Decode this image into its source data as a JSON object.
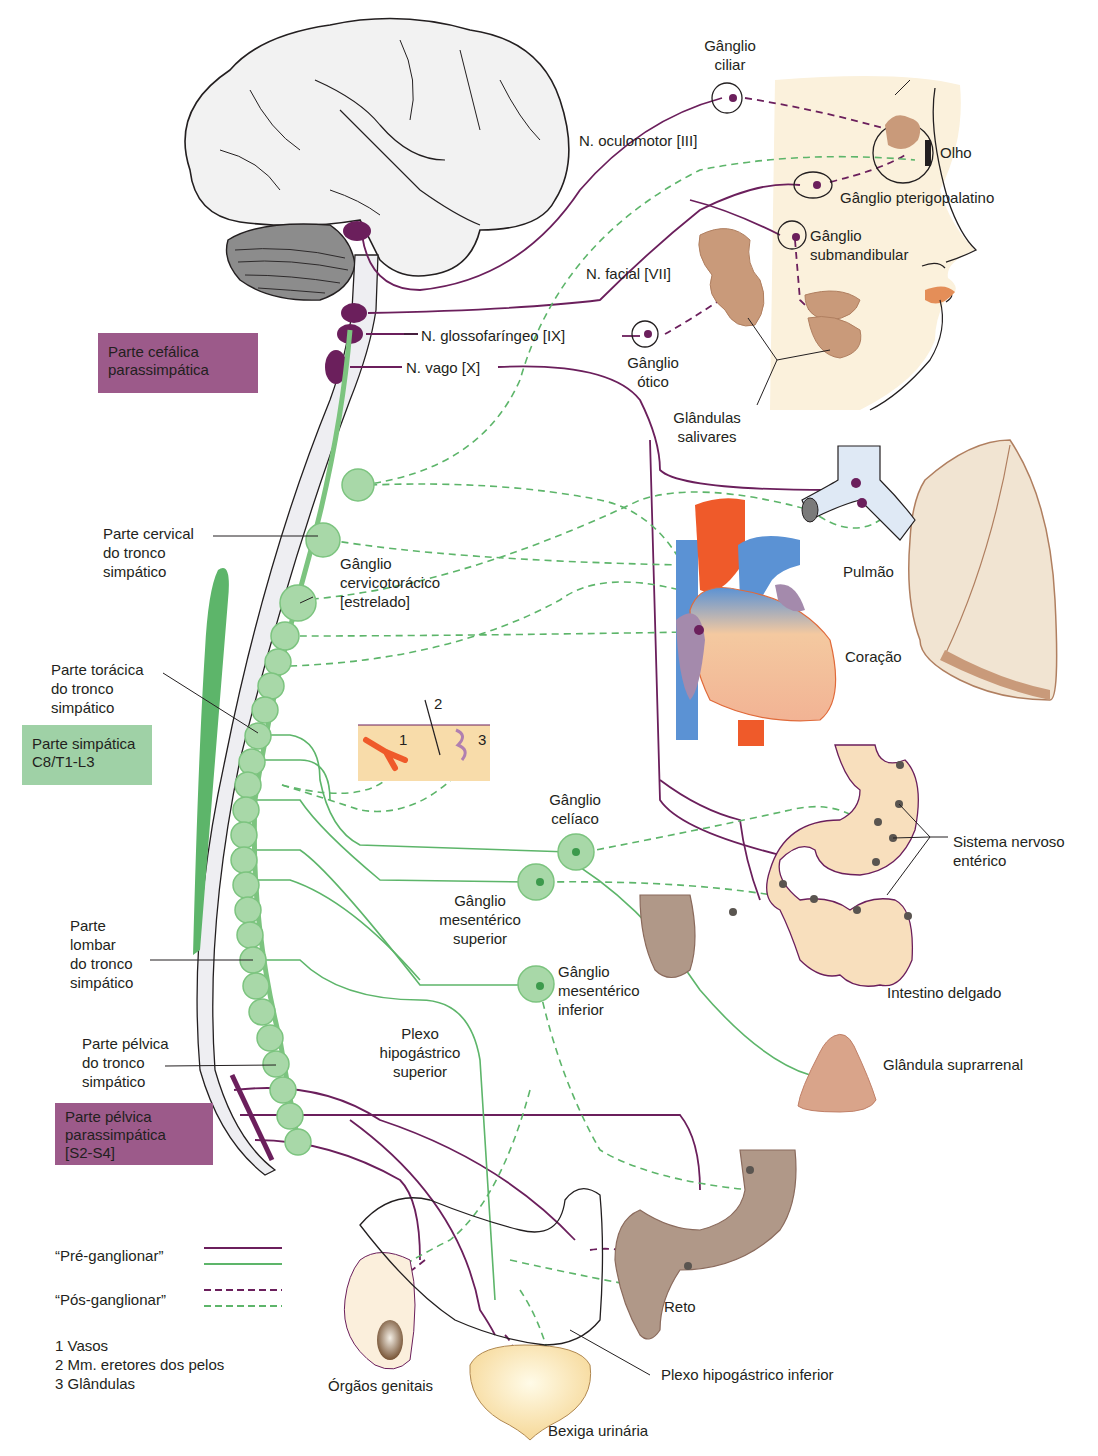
{
  "colors": {
    "parasympathetic": "#6b1f5c",
    "sympathetic": "#5db56a",
    "ganglion_fill": "#a8d8a8",
    "gland": "#c99a7a",
    "skin": "#fbf1dc",
    "para_box": "#9c5a8a",
    "symp_box": "#9fd1a6"
  },
  "boxes": {
    "cephalic": [
      "Parte cefálica",
      "parassimpática"
    ],
    "sympathetic": [
      "Parte simpática",
      "C8/T1-L3"
    ],
    "pelvic": [
      "Parte pélvica",
      "parassimpática",
      "[S2-S4]"
    ]
  },
  "nerves": {
    "oculomotor": "N. oculomotor [III]",
    "facial": "N. facial [VII]",
    "glossopharyngeal": "N. glossofaríngeo [IX]",
    "vagus": "N. vago [X]"
  },
  "head_labels": {
    "ciliary_ganglion": [
      "Gânglio",
      "ciliar"
    ],
    "eye": "Olho",
    "pterygopalatine_ganglion": "Gânglio pterigopalatino",
    "submandibular_ganglion": [
      "Gânglio",
      "submandibular"
    ],
    "otic_ganglion": [
      "Gânglio",
      "ótico"
    ],
    "salivary_glands": [
      "Glândulas",
      "salivares"
    ]
  },
  "trunk_labels": {
    "cervical": [
      "Parte cervical",
      "do tronco",
      "simpático"
    ],
    "cervicothoracic": [
      "Gânglio",
      "cervicotorácico",
      "[estrelado]"
    ],
    "thoracic": [
      "Parte torácica",
      "do tronco",
      "simpático"
    ],
    "lumbar": [
      "Parte",
      "lombar",
      "do tronco",
      "simpático"
    ],
    "pelvic": [
      "Parte pélvica",
      "do tronco",
      "simpático"
    ]
  },
  "inset_numbers": [
    "1",
    "2",
    "3"
  ],
  "abdominal_labels": {
    "celiac": [
      "Gânglio",
      "celíaco"
    ],
    "superior_mesenteric": [
      "Gânglio",
      "mesentérico",
      "superior"
    ],
    "inferior_mesenteric": [
      "Gânglio",
      "mesentérico",
      "inferior"
    ],
    "superior_hypogastric": [
      "Plexo",
      "hipogástrico",
      "superior"
    ],
    "inferior_hypogastric": "Plexo hipogástrico inferior"
  },
  "organs": {
    "lung": "Pulmão",
    "heart": "Coração",
    "enteric": [
      "Sistema nervoso",
      "entérico"
    ],
    "small_intestine": "Intestino delgado",
    "adrenal": "Glândula suprarrenal",
    "rectum": "Reto",
    "genitals": "Órgãos genitais",
    "bladder": "Bexiga urinária"
  },
  "legend": {
    "preganglionic": "“Pré-ganglionar”",
    "postganglionic": "“Pós-ganglionar”",
    "key": [
      "1  Vasos",
      "2  Mm. eretores dos pelos",
      "3  Glândulas"
    ]
  }
}
